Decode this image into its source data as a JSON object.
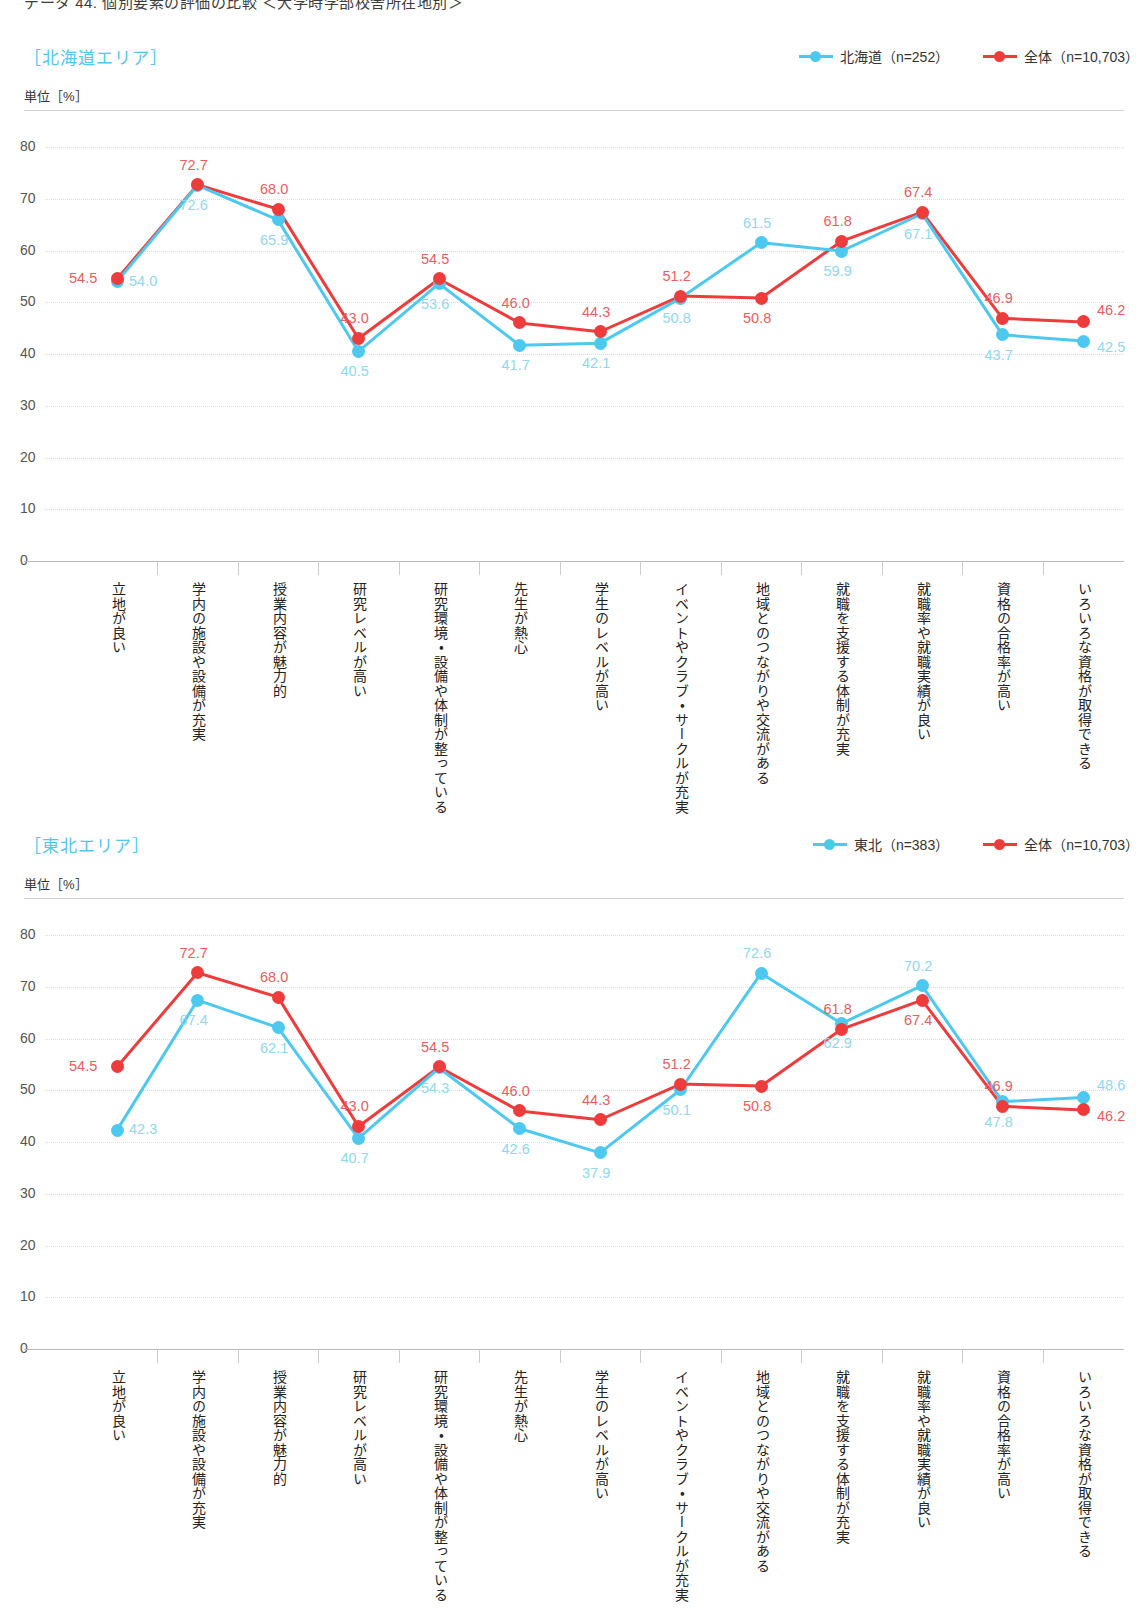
{
  "page_title": "データ 44. 個別要素の評価の比較 ＜大学時学部校舎所在地別＞",
  "colors": {
    "total": "#ee3b3b",
    "area": "#4dc8ee",
    "area_title": "#4dc8ee",
    "grid": "#dcdcdc",
    "axis": "#b9b9b9"
  },
  "unit_label": "単位［%］",
  "categories": [
    "立地が良い",
    "学内の施設や設備が充実",
    "授業内容が魅力的",
    "研究レベルが高い",
    "研究環境・設備や体制が整っている",
    "先生が熱心",
    "学生のレベルが高い",
    "イベントやクラブ・サークルが充実",
    "地域とのつながりや交流がある",
    "就職を支援する体制が充実",
    "就職率や就職実績が良い",
    "資格の合格率が高い",
    "いろいろな資格が取得できる"
  ],
  "yticks": [
    0,
    10,
    20,
    30,
    40,
    50,
    60,
    70,
    80
  ],
  "charts": [
    {
      "area_title": "［北海道エリア］",
      "legend": [
        {
          "label": "北海道（n=252）",
          "color": "#4dc8ee",
          "key": "area"
        },
        {
          "label": "全体（n=10,703）",
          "color": "#ee3b3b",
          "key": "total"
        }
      ],
      "chart_data": {
        "type": "line",
        "title": "［北海道エリア］",
        "xlabel": "",
        "ylabel": "単位［%］",
        "ylim": [
          0,
          80
        ],
        "grid": true,
        "legend_position": "top-right",
        "categories": [
          "立地が良い",
          "学内の施設や設備が充実",
          "授業内容が魅力的",
          "研究レベルが高い",
          "研究環境・設備や体制が整っている",
          "先生が熱心",
          "学生のレベルが高い",
          "イベントやクラブ・サークルが充実",
          "地域とのつながりや交流がある",
          "就職を支援する体制が充実",
          "就職率や就職実績が良い",
          "資格の合格率が高い",
          "いろいろな資格が取得できる"
        ],
        "series": [
          {
            "name": "北海道（n=252）",
            "color": "#4dc8ee",
            "values": [
              54.0,
              72.6,
              65.9,
              40.5,
              53.6,
              41.7,
              42.1,
              50.8,
              61.5,
              59.9,
              67.1,
              43.7,
              42.5
            ]
          },
          {
            "name": "全体（n=10,703）",
            "color": "#ee3b3b",
            "values": [
              54.5,
              72.7,
              68.0,
              43.0,
              54.5,
              46.0,
              44.3,
              51.2,
              50.8,
              61.8,
              67.4,
              46.9,
              46.2
            ]
          }
        ]
      }
    },
    {
      "area_title": "［東北エリア］",
      "legend": [
        {
          "label": "東北（n=383）",
          "color": "#4dc8ee",
          "key": "area"
        },
        {
          "label": "全体（n=10,703）",
          "color": "#ee3b3b",
          "key": "total"
        }
      ],
      "chart_data": {
        "type": "line",
        "title": "［東北エリア］",
        "xlabel": "",
        "ylabel": "単位［%］",
        "ylim": [
          0,
          80
        ],
        "grid": true,
        "legend_position": "top-right",
        "categories": [
          "立地が良い",
          "学内の施設や設備が充実",
          "授業内容が魅力的",
          "研究レベルが高い",
          "研究環境・設備や体制が整っている",
          "先生が熱心",
          "学生のレベルが高い",
          "イベントやクラブ・サークルが充実",
          "地域とのつながりや交流がある",
          "就職を支援する体制が充実",
          "就職率や就職実績が良い",
          "資格の合格率が高い",
          "いろいろな資格が取得できる"
        ],
        "series": [
          {
            "name": "東北（n=383）",
            "color": "#4dc8ee",
            "values": [
              42.3,
              67.4,
              62.1,
              40.7,
              54.3,
              42.6,
              37.9,
              50.1,
              72.6,
              62.9,
              70.2,
              47.8,
              48.6
            ]
          },
          {
            "name": "全体（n=10,703）",
            "color": "#ee3b3b",
            "values": [
              54.5,
              72.7,
              68.0,
              43.0,
              54.5,
              46.0,
              44.3,
              51.2,
              50.8,
              61.8,
              67.4,
              46.9,
              46.2
            ]
          }
        ]
      }
    }
  ]
}
